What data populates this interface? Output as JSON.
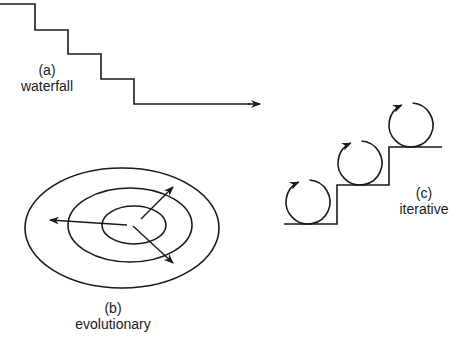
{
  "diagram": {
    "stroke_color": "#1a1a1a",
    "background": "#ffffff",
    "panels": {
      "waterfall": {
        "letter": "(a)",
        "name": "waterfall",
        "label_pos": {
          "x": 47,
          "y": 62
        },
        "path_points": [
          [
            0,
            4
          ],
          [
            35,
            4
          ],
          [
            35,
            30
          ],
          [
            68,
            30
          ],
          [
            68,
            54
          ],
          [
            101,
            54
          ],
          [
            101,
            79
          ],
          [
            134,
            79
          ],
          [
            134,
            104
          ],
          [
            250,
            104
          ]
        ],
        "arrow_tip": [
          260,
          104
        ]
      },
      "evolutionary": {
        "letter": "(b)",
        "name": "evolutionary",
        "label_pos": {
          "x": 113,
          "y": 300
        },
        "ellipses": [
          {
            "cx": 122,
            "cy": 228,
            "rx": 97,
            "ry": 60
          },
          {
            "cx": 130,
            "cy": 225,
            "rx": 62,
            "ry": 37
          },
          {
            "cx": 134,
            "cy": 225,
            "rx": 32,
            "ry": 19
          }
        ],
        "arrows": [
          {
            "from": [
              127,
              225
            ],
            "to": [
              50,
              220
            ]
          },
          {
            "from": [
              141,
              219
            ],
            "to": [
              173,
              187
            ]
          },
          {
            "from": [
              133,
              226
            ],
            "to": [
              173,
              263
            ]
          }
        ]
      },
      "iterative": {
        "letter": "(c)",
        "name": "iterative",
        "label_pos": {
          "x": 424,
          "y": 185
        },
        "path_points": [
          [
            284,
            224
          ],
          [
            337,
            224
          ],
          [
            337,
            185
          ],
          [
            389,
            185
          ],
          [
            389,
            147
          ],
          [
            442,
            147
          ]
        ],
        "cycles": [
          {
            "cx": 308,
            "cy": 202,
            "r": 22
          },
          {
            "cx": 360,
            "cy": 163,
            "r": 22
          },
          {
            "cx": 411,
            "cy": 125,
            "r": 22
          }
        ]
      }
    }
  }
}
